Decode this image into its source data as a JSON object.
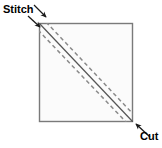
{
  "diagram": {
    "type": "sewing-instruction-diagram",
    "background_color": "#ffffff",
    "labels": {
      "stitch": "Stitch",
      "cut": "Cut"
    },
    "shape": {
      "name": "fabric-square",
      "fill_color": "#fbfbfb",
      "stroke_color": "#7a7a7a",
      "x": 39,
      "y": 23,
      "width": 94,
      "height": 99
    },
    "lines": {
      "cut_line": {
        "name": "cut-line",
        "style": "solid",
        "color": "#555555",
        "from": [
          39,
          23
        ],
        "to": [
          133,
          122
        ]
      },
      "stitch_line_upper": {
        "name": "stitch-line-upper",
        "style": "dashed",
        "color": "#8a8a8a",
        "from": [
          39,
          30
        ],
        "to": [
          126,
          122
        ]
      },
      "stitch_line_lower": {
        "name": "stitch-line-lower",
        "style": "dashed",
        "color": "#8a8a8a",
        "from": [
          46,
          23
        ],
        "to": [
          133,
          115
        ]
      }
    },
    "arrows": {
      "stitch_arrow_upper": {
        "name": "stitch-arrow-upper",
        "color": "#1a1a1a",
        "from": [
          34,
          5
        ],
        "to": [
          47,
          18
        ]
      },
      "stitch_arrow_lower": {
        "name": "stitch-arrow-lower",
        "color": "#1a1a1a",
        "from": [
          28,
          16
        ],
        "to": [
          41,
          28
        ]
      },
      "cut_arrow": {
        "name": "cut-arrow",
        "color": "#1a1a1a",
        "from": [
          150,
          137
        ],
        "to": [
          135,
          124
        ]
      }
    }
  }
}
